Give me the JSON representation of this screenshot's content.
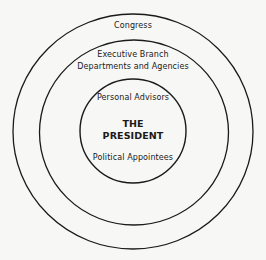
{
  "diagram": {
    "type": "concentric-circles",
    "rings": [
      {
        "name": "outer",
        "label": "Congress"
      },
      {
        "name": "middle",
        "label_line1": "Executive Branch",
        "label_line2": "Departments and Agencies"
      },
      {
        "name": "inner",
        "label_top": "Personal Advisors",
        "label_bottom": "Political Appointees"
      }
    ],
    "center": {
      "line1": "THE",
      "line2": "PRESIDENT"
    },
    "stroke_color": "#1a1a1a",
    "background": "#f7f7f5"
  }
}
